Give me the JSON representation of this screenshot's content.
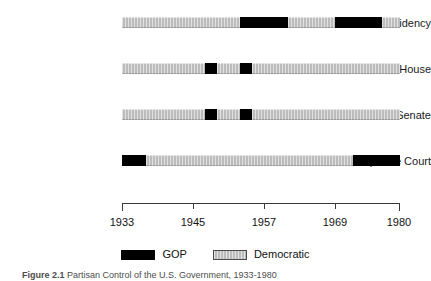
{
  "chart_data": {
    "type": "bar",
    "title": "",
    "subtitle": "",
    "xlabel": "",
    "ylabel": "",
    "xlim": [
      1933,
      1980
    ],
    "grid": false,
    "orientation": "horizontal-timeline",
    "tick_labels": [
      "1933",
      "1945",
      "1957",
      "1969",
      "1980"
    ],
    "tick_values": [
      1933,
      1945,
      1957,
      1969,
      1980
    ],
    "categories": [
      "Presidency",
      "House",
      "Senate",
      "Supreme Court"
    ],
    "legend": {
      "position": "bottom-center",
      "entries": [
        {
          "label": "GOP",
          "color": "#000000",
          "key": "gop"
        },
        {
          "label": "Democratic",
          "color": "#bcbcbc",
          "key": "dem"
        }
      ]
    },
    "series": [
      {
        "name": "Presidency",
        "segments": [
          {
            "party": "dem",
            "start": 1933,
            "end": 1953
          },
          {
            "party": "gop",
            "start": 1953,
            "end": 1961
          },
          {
            "party": "dem",
            "start": 1961,
            "end": 1969
          },
          {
            "party": "gop",
            "start": 1969,
            "end": 1977
          },
          {
            "party": "dem",
            "start": 1977,
            "end": 1980
          }
        ]
      },
      {
        "name": "House",
        "segments": [
          {
            "party": "dem",
            "start": 1933,
            "end": 1947
          },
          {
            "party": "gop",
            "start": 1947,
            "end": 1949
          },
          {
            "party": "dem",
            "start": 1949,
            "end": 1953
          },
          {
            "party": "gop",
            "start": 1953,
            "end": 1955
          },
          {
            "party": "dem",
            "start": 1955,
            "end": 1980
          }
        ]
      },
      {
        "name": "Senate",
        "segments": [
          {
            "party": "dem",
            "start": 1933,
            "end": 1947
          },
          {
            "party": "gop",
            "start": 1947,
            "end": 1949
          },
          {
            "party": "dem",
            "start": 1949,
            "end": 1953
          },
          {
            "party": "gop",
            "start": 1953,
            "end": 1955
          },
          {
            "party": "dem",
            "start": 1955,
            "end": 1980
          }
        ]
      },
      {
        "name": "Supreme Court",
        "segments": [
          {
            "party": "gop",
            "start": 1933,
            "end": 1937
          },
          {
            "party": "dem",
            "start": 1937,
            "end": 1972
          },
          {
            "party": "gop",
            "start": 1972,
            "end": 1980
          }
        ]
      }
    ]
  },
  "row_labels": {
    "presidency": "Presidency",
    "house": "House",
    "senate": "Senate",
    "supreme_court": "Supreme Court"
  },
  "axis": {
    "tick_1": "1933",
    "tick_2": "1945",
    "tick_3": "1957",
    "tick_4": "1969",
    "tick_5": "1980"
  },
  "legend": {
    "gop_label": "GOP",
    "democratic_label": "Democratic"
  },
  "caption": {
    "figure_number": "Figure 2.1",
    "text": "Partisan Control of the U.S. Government, 1933-1980"
  }
}
